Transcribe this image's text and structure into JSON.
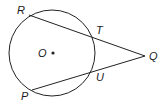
{
  "diagram": {
    "type": "circle-secants",
    "circle": {
      "center_label": "O",
      "cx": 52,
      "cy": 53,
      "r": 43
    },
    "points": [
      {
        "label": "R",
        "x": 29,
        "y": 15,
        "label_x": 17,
        "label_y": 14
      },
      {
        "label": "T",
        "x": 93,
        "y": 37,
        "label_x": 96,
        "label_y": 34
      },
      {
        "label": "Q",
        "x": 145,
        "y": 56,
        "label_x": 149,
        "label_y": 60
      },
      {
        "label": "U",
        "x": 92,
        "y": 73,
        "label_x": 96,
        "label_y": 81
      },
      {
        "label": "P",
        "x": 32,
        "y": 90,
        "label_x": 21,
        "label_y": 100
      }
    ],
    "segments": [
      {
        "from": "R",
        "to": "Q"
      },
      {
        "from": "P",
        "to": "Q"
      }
    ],
    "center": {
      "label": "O",
      "dot_x": 53,
      "dot_y": 53,
      "label_x": 38,
      "label_y": 57
    },
    "colors": {
      "stroke": "#222222",
      "background": "#ffffff"
    }
  }
}
